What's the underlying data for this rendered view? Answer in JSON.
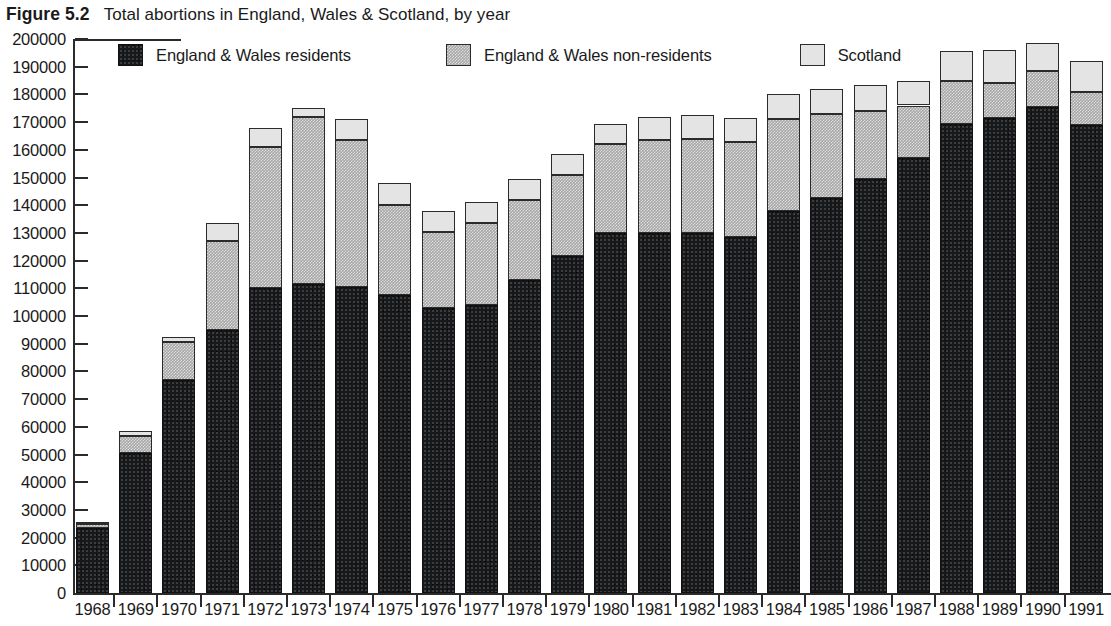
{
  "figure": {
    "label": "Figure 5.2",
    "title": "Total abortions in England, Wales & Scotland, by year"
  },
  "colors": {
    "residents": "#17181a",
    "non_residents": "#a7a7a7",
    "scotland": "#e4e4e4",
    "axis": "#2b2b2b",
    "background": "#ffffff"
  },
  "legend": {
    "position": "top-inside",
    "items": [
      {
        "label": "England & Wales residents",
        "swatch": "residents-swatch"
      },
      {
        "label": "England & Wales non-residents",
        "swatch": "non-residents-swatch"
      },
      {
        "label": "Scotland",
        "swatch": "scotland-swatch"
      }
    ]
  },
  "axis": {
    "y_ticks": [
      "200000",
      "190000",
      "180000",
      "170000",
      "160000",
      "150000",
      "140000",
      "130000",
      "120000",
      "110000",
      "100000",
      "90000",
      "80000",
      "70000",
      "60000",
      "50000",
      "40000",
      "30000",
      "20000",
      "10000",
      "0"
    ],
    "x_ticks": [
      "1968",
      "1969",
      "1970",
      "1971",
      "1972",
      "1973",
      "1974",
      "1975",
      "1976",
      "1977",
      "1978",
      "1979",
      "1980",
      "1981",
      "1982",
      "1983",
      "1984",
      "1985",
      "1986",
      "1987",
      "1988",
      "1989",
      "1990",
      "1991"
    ]
  },
  "chart_data": {
    "type": "bar",
    "stacked": true,
    "title": "Total abortions in England, Wales & Scotland, by year",
    "xlabel": "",
    "ylabel": "",
    "ylim": [
      0,
      200000
    ],
    "ytick_step": 10000,
    "grid": false,
    "legend_position": "top-inside",
    "categories": [
      "1968",
      "1969",
      "1970",
      "1971",
      "1972",
      "1973",
      "1974",
      "1975",
      "1976",
      "1977",
      "1978",
      "1979",
      "1980",
      "1981",
      "1982",
      "1983",
      "1984",
      "1985",
      "1986",
      "1987",
      "1988",
      "1989",
      "1990",
      "1991"
    ],
    "series": [
      {
        "name": "England & Wales residents",
        "color": "#17181a",
        "values": [
          23600,
          50500,
          77000,
          95000,
          110000,
          111500,
          110500,
          107500,
          103000,
          104000,
          113000,
          121500,
          130000,
          130000,
          130000,
          128500,
          138000,
          142500,
          149500,
          157000,
          169500,
          171500,
          175500,
          169000
        ]
      },
      {
        "name": "England & Wales non-residents",
        "color": "#a7a7a7",
        "values": [
          1400,
          6300,
          13500,
          32000,
          51000,
          60500,
          53000,
          32500,
          27500,
          29500,
          29000,
          29500,
          32000,
          33500,
          34000,
          34500,
          33000,
          30500,
          24500,
          19000,
          15500,
          12500,
          13000,
          12000
        ]
      },
      {
        "name": "Scotland",
        "color": "#e4e4e4",
        "values": [
          600,
          1700,
          2000,
          6500,
          7000,
          3000,
          7500,
          8000,
          7500,
          7500,
          7500,
          7500,
          7500,
          8500,
          8500,
          8500,
          9000,
          9000,
          9500,
          9000,
          10500,
          12000,
          10000,
          11000
        ]
      }
    ],
    "totals": [
      25600,
      58500,
      92500,
      133500,
      168000,
      175000,
      171000,
      148000,
      138000,
      141000,
      149500,
      158500,
      169500,
      172000,
      172500,
      171500,
      180000,
      182000,
      183500,
      185000,
      195500,
      196000,
      198500,
      192000
    ]
  }
}
